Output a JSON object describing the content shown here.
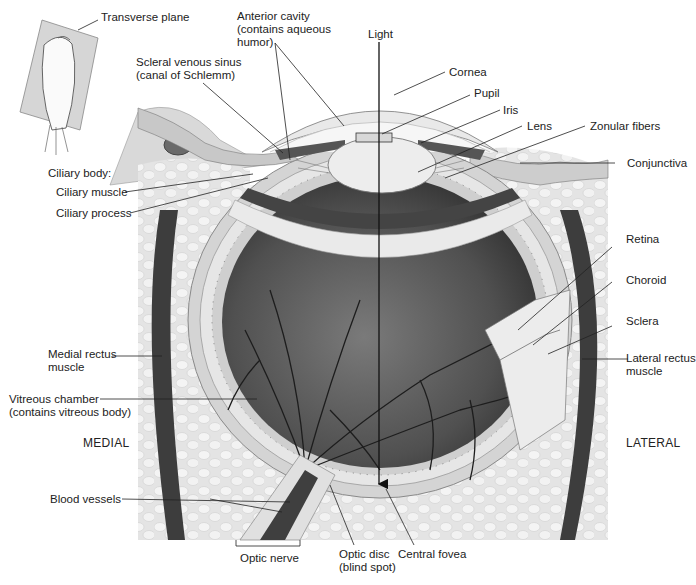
{
  "figure": {
    "colors": {
      "background": "#ffffff",
      "tissue_light": "#e8e8e8",
      "tissue_mid": "#bdbdbd",
      "vitreous_dark": "#4a4a4a",
      "muscle_dark": "#3a3a3a",
      "leader_line": "#222222"
    }
  },
  "inset": {
    "label": "Transverse plane"
  },
  "labels": {
    "scleral_sinus_line1": "Scleral venous sinus",
    "scleral_sinus_line2": "(canal of Schlemm)",
    "anterior_cavity_line1": "Anterior cavity",
    "anterior_cavity_line2": "(contains aqueous",
    "anterior_cavity_line3": "humor)",
    "light": "Light",
    "cornea": "Cornea",
    "pupil": "Pupil",
    "iris": "Iris",
    "lens": "Lens",
    "zonular_fibers": "Zonular fibers",
    "conjunctiva": "Conjunctiva",
    "ciliary_body": "Ciliary body:",
    "ciliary_muscle": "Ciliary muscle",
    "ciliary_process": "Ciliary process",
    "retina": "Retina",
    "choroid": "Choroid",
    "sclera": "Sclera",
    "medial_rectus_line1": "Medial rectus",
    "medial_rectus_line2": "muscle",
    "lateral_rectus_line1": "Lateral rectus",
    "lateral_rectus_line2": "muscle",
    "vitreous_line1": "Vitreous chamber",
    "vitreous_line2": "(contains vitreous body)",
    "medial": "MEDIAL",
    "lateral": "LATERAL",
    "blood_vessels": "Blood vessels",
    "optic_nerve": "Optic nerve",
    "optic_disc_line1": "Optic disc",
    "optic_disc_line2": "(blind spot)",
    "central_fovea": "Central fovea"
  }
}
